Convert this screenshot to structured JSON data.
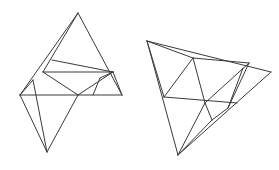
{
  "canvas": {
    "width": 279,
    "height": 170,
    "background": "#ffffff",
    "stroke_color": "#3a3a3a",
    "stroke_width": 1,
    "description": "Two line-art triangular lattice figures side by side on a plain white field"
  },
  "figures": [
    {
      "id": "left-figure",
      "label": "Upright triangular lattice figure",
      "orientation": "upright",
      "vertices": {
        "apex": [
          78,
          13
        ],
        "left_mid": [
          43,
          72
        ],
        "right_mid": [
          113,
          72
        ],
        "mid_center": [
          78,
          72
        ],
        "left_base": [
          20,
          95
        ],
        "center_base": [
          78,
          95
        ],
        "right_base": [
          122,
          95
        ],
        "bottom": [
          47,
          152
        ],
        "upper_left_band": [
          52,
          60
        ],
        "inner_right_band": [
          113,
          72
        ],
        "wedge_point": [
          100,
          78
        ],
        "wedge_foot": [
          93,
          95
        ],
        "left_base_inner": [
          33,
          80
        ]
      },
      "edges": [
        [
          78,
          13,
          20,
          95
        ],
        [
          78,
          13,
          122,
          95
        ],
        [
          20,
          95,
          122,
          95
        ],
        [
          52,
          60,
          113,
          72
        ],
        [
          43,
          72,
          113,
          72
        ],
        [
          43,
          72,
          78,
          13
        ],
        [
          78,
          95,
          43,
          72
        ],
        [
          78,
          95,
          113,
          72
        ],
        [
          33,
          80,
          20,
          95
        ],
        [
          33,
          80,
          47,
          152
        ],
        [
          20,
          95,
          47,
          152
        ],
        [
          78,
          95,
          47,
          152
        ],
        [
          113,
          72,
          100,
          78
        ],
        [
          100,
          78,
          93,
          95
        ],
        [
          113,
          72,
          122,
          95
        ]
      ]
    },
    {
      "id": "right-figure",
      "label": "Rotated triangular lattice figure",
      "orientation": "rotated",
      "vertices": {
        "top_left": [
          147,
          41
        ],
        "right_tip": [
          271,
          72
        ],
        "bottom": [
          178,
          155
        ],
        "upper_band_left": [
          193,
          58
        ],
        "upper_band_right": [
          249,
          63
        ],
        "left_mid": [
          164,
          97
        ],
        "lower_band_right": [
          237,
          103
        ],
        "center": [
          205,
          103
        ],
        "inner_apex": [
          212,
          120
        ],
        "right_inner": [
          243,
          68
        ],
        "right_lower": [
          228,
          108
        ]
      },
      "edges": [
        [
          147,
          41,
          271,
          72
        ],
        [
          147,
          41,
          178,
          155
        ],
        [
          178,
          155,
          271,
          72
        ],
        [
          193,
          58,
          249,
          63
        ],
        [
          193,
          58,
          147,
          41
        ],
        [
          164,
          97,
          237,
          103
        ],
        [
          193,
          58,
          164,
          97
        ],
        [
          193,
          58,
          205,
          103
        ],
        [
          249,
          63,
          205,
          103
        ],
        [
          249,
          63,
          228,
          108
        ],
        [
          228,
          108,
          243,
          68
        ],
        [
          205,
          103,
          212,
          120
        ],
        [
          212,
          120,
          228,
          108
        ],
        [
          205,
          103,
          178,
          155
        ],
        [
          212,
          120,
          178,
          155
        ],
        [
          164,
          97,
          147,
          41
        ]
      ]
    }
  ]
}
